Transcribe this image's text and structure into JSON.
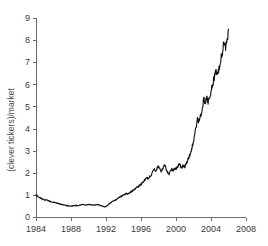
{
  "chart_data": {
    "type": "line",
    "title": "",
    "subtitle": "",
    "xlabel": "",
    "ylabel": "(clever tickers)/market",
    "xlim": [
      1984,
      2008
    ],
    "ylim": [
      0,
      9
    ],
    "grid": false,
    "legend": null,
    "x_ticks": [
      "1984",
      "1988",
      "1992",
      "1996",
      "2000",
      "2004",
      "2008"
    ],
    "x_tick_values": [
      1984,
      1988,
      1992,
      1996,
      2000,
      2004,
      2008
    ],
    "y_ticks": [
      "0",
      "1",
      "2",
      "3",
      "4",
      "5",
      "6",
      "7",
      "8",
      "9"
    ],
    "y_tick_values": [
      0,
      1,
      2,
      3,
      4,
      5,
      6,
      7,
      8,
      9
    ],
    "series": [
      {
        "name": "(clever tickers)/market",
        "color": "#101010",
        "x": [
          1984.0,
          1984.17,
          1984.33,
          1984.5,
          1984.67,
          1984.83,
          1985.0,
          1985.17,
          1985.33,
          1985.5,
          1985.67,
          1985.83,
          1986.0,
          1986.17,
          1986.33,
          1986.5,
          1986.67,
          1986.83,
          1987.0,
          1987.17,
          1987.33,
          1987.5,
          1987.67,
          1987.83,
          1988.0,
          1988.17,
          1988.33,
          1988.5,
          1988.67,
          1988.83,
          1989.0,
          1989.17,
          1989.33,
          1989.5,
          1989.67,
          1989.83,
          1990.0,
          1990.17,
          1990.33,
          1990.5,
          1990.67,
          1990.83,
          1991.0,
          1991.17,
          1991.33,
          1991.5,
          1991.67,
          1991.83,
          1992.0,
          1992.17,
          1992.33,
          1992.5,
          1992.67,
          1992.83,
          1993.0,
          1993.17,
          1993.33,
          1993.5,
          1993.67,
          1993.83,
          1994.0,
          1994.17,
          1994.33,
          1994.5,
          1994.67,
          1994.83,
          1995.0,
          1995.17,
          1995.33,
          1995.5,
          1995.67,
          1995.83,
          1996.0,
          1996.17,
          1996.33,
          1996.5,
          1996.67,
          1996.83,
          1997.0,
          1997.17,
          1997.33,
          1997.5,
          1997.67,
          1997.83,
          1998.0,
          1998.17,
          1998.33,
          1998.5,
          1998.67,
          1998.83,
          1999.0,
          1999.17,
          1999.33,
          1999.5,
          1999.67,
          1999.83,
          2000.0,
          2000.17,
          2000.33,
          2000.5,
          2000.67,
          2000.83,
          2001.0,
          2001.17,
          2001.33,
          2001.5,
          2001.67,
          2001.83,
          2002.0,
          2002.17,
          2002.33,
          2002.5,
          2002.67,
          2002.83,
          2003.0,
          2003.17,
          2003.33,
          2003.5,
          2003.67,
          2003.83,
          2004.0,
          2004.17,
          2004.33,
          2004.5,
          2004.67,
          2004.83,
          2005.0,
          2005.17,
          2005.33,
          2005.5,
          2005.67,
          2005.83,
          2006.0
        ],
        "y": [
          1.0,
          0.95,
          0.88,
          0.86,
          0.82,
          0.8,
          0.78,
          0.76,
          0.75,
          0.72,
          0.7,
          0.69,
          0.67,
          0.66,
          0.64,
          0.62,
          0.6,
          0.58,
          0.56,
          0.55,
          0.53,
          0.52,
          0.51,
          0.5,
          0.49,
          0.5,
          0.52,
          0.53,
          0.52,
          0.51,
          0.53,
          0.55,
          0.56,
          0.55,
          0.54,
          0.56,
          0.57,
          0.56,
          0.55,
          0.54,
          0.53,
          0.55,
          0.56,
          0.55,
          0.53,
          0.5,
          0.48,
          0.46,
          0.48,
          0.52,
          0.58,
          0.63,
          0.68,
          0.72,
          0.75,
          0.8,
          0.84,
          0.88,
          0.92,
          0.95,
          0.99,
          1.03,
          1.06,
          1.04,
          1.08,
          1.14,
          1.18,
          1.22,
          1.28,
          1.33,
          1.38,
          1.42,
          1.48,
          1.55,
          1.62,
          1.7,
          1.78,
          1.72,
          1.8,
          1.92,
          2.05,
          2.16,
          2.08,
          2.18,
          2.3,
          2.18,
          2.05,
          2.22,
          2.36,
          2.2,
          2.05,
          1.92,
          2.02,
          2.18,
          2.1,
          2.22,
          2.15,
          2.28,
          2.4,
          2.32,
          2.22,
          2.34,
          2.28,
          2.42,
          2.55,
          2.7,
          2.9,
          3.15,
          3.45,
          3.8,
          4.15,
          4.45,
          4.3,
          4.6,
          4.95,
          5.3,
          5.15,
          5.4,
          5.2,
          5.45,
          5.7,
          5.95,
          6.2,
          6.45,
          6.7,
          6.5,
          6.95,
          7.25,
          7.55,
          7.8,
          7.6,
          7.9,
          8.5
        ]
      }
    ]
  }
}
